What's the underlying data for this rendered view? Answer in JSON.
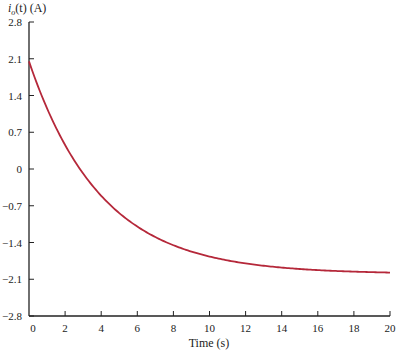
{
  "chart_data": {
    "type": "line",
    "title": "",
    "ylabel_parts": {
      "symbol": "i",
      "subscript": "o",
      "rest": "(t) (A)"
    },
    "ylabel": "i_o(t) (A)",
    "xlabel": "Time (s)",
    "xlim": [
      0,
      20
    ],
    "ylim": [
      -2.8,
      2.8
    ],
    "x_ticks": [
      0,
      2,
      4,
      6,
      8,
      10,
      12,
      14,
      16,
      18,
      20
    ],
    "x_tick_labels": [
      "0",
      "2",
      "4",
      "6",
      "8",
      "10",
      "12",
      "14",
      "16",
      "18",
      "20"
    ],
    "y_ticks": [
      2.8,
      2.1,
      1.4,
      0.7,
      0,
      -0.7,
      -1.4,
      -2.1,
      -2.8
    ],
    "y_tick_labels": [
      "2.8",
      "2.1",
      "1.4",
      "0.7",
      "0",
      "−0.7",
      "−1.4",
      "−2.1",
      "−2.8"
    ],
    "grid": false,
    "legend": null,
    "series": [
      {
        "name": "i_o(t)",
        "color": "#b5283a",
        "x": [
          0,
          1,
          2,
          3,
          4,
          5,
          6,
          7,
          8,
          9,
          10,
          11,
          12,
          13,
          14,
          15,
          16,
          17,
          18,
          19,
          20
        ],
        "values": [
          2.05,
          1.15,
          0.46,
          -0.09,
          -0.51,
          -0.84,
          -1.1,
          -1.3,
          -1.45,
          -1.57,
          -1.67,
          -1.74,
          -1.8,
          -1.84,
          -1.88,
          -1.91,
          -1.93,
          -1.94,
          -1.95,
          -1.96,
          -1.97
        ]
      }
    ]
  }
}
